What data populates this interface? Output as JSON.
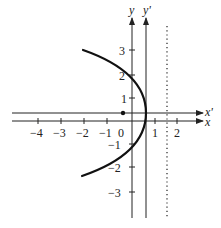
{
  "diagram": {
    "type": "coordinate-plot",
    "axes": {
      "x_label": "x",
      "y_label": "y",
      "x_prime_label": "x'",
      "y_prime_label": "y'"
    },
    "x_ticks": [
      "−4",
      "−3",
      "−2",
      "−1",
      "0",
      "1",
      "2"
    ],
    "y_ticks": [
      "3",
      "2",
      "1",
      "−1",
      "−2",
      "−3"
    ],
    "curve": {
      "shape": "parabola",
      "opens": "left",
      "vertex": [
        0.6,
        0.35
      ],
      "color": "#111111"
    },
    "point": {
      "label": "focus",
      "coords": [
        -0.4,
        0.35
      ]
    },
    "directrix": {
      "style": "dotted",
      "x": 1.55
    },
    "colors": {
      "ink": "#222222",
      "background": "#ffffff"
    }
  }
}
